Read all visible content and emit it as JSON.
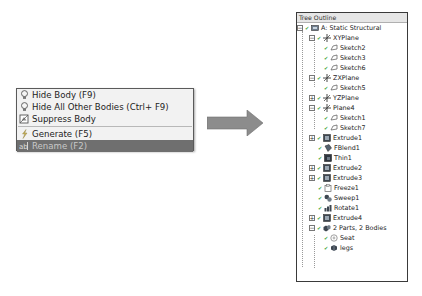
{
  "context_menu": {
    "items": [
      {
        "label": "Hide Body (F9)",
        "icon": "lightbulb-icon"
      },
      {
        "label": "Hide All Other Bodies (Ctrl+ F9)",
        "icon": "lightbulb-icon"
      },
      {
        "label": "Suppress Body",
        "icon": "suppress-body-icon"
      },
      {
        "label": "Generate (F5)",
        "icon": "lightning-icon"
      },
      {
        "label": "Rename (F2)",
        "icon": "rename-icon",
        "selected": true
      }
    ]
  },
  "tree_outline": {
    "title": "Tree Outline",
    "nodes": [
      {
        "label": "A: Static Structural",
        "level": 0,
        "expander": "−",
        "icon": "model-icon"
      },
      {
        "label": "XYPlane",
        "level": 1,
        "expander": "−",
        "icon": "plane-icon"
      },
      {
        "label": "Sketch2",
        "level": 2,
        "icon": "sketch-icon"
      },
      {
        "label": "Sketch3",
        "level": 2,
        "icon": "sketch-icon"
      },
      {
        "label": "Sketch6",
        "level": 2,
        "icon": "sketch-icon"
      },
      {
        "label": "ZXPlane",
        "level": 1,
        "expander": "−",
        "icon": "plane-icon"
      },
      {
        "label": "Sketch5",
        "level": 2,
        "icon": "sketch-icon"
      },
      {
        "label": "YZPlane",
        "level": 1,
        "expander": "+",
        "icon": "plane-icon"
      },
      {
        "label": "Plane4",
        "level": 1,
        "expander": "−",
        "icon": "plane-icon"
      },
      {
        "label": "Sketch1",
        "level": 2,
        "icon": "sketch-icon"
      },
      {
        "label": "Sketch7",
        "level": 2,
        "icon": "sketch-icon"
      },
      {
        "label": "Extrude1",
        "level": 1,
        "expander": "+",
        "icon": "extrude-icon"
      },
      {
        "label": "FBlend1",
        "level": 1,
        "icon": "blend-icon"
      },
      {
        "label": "Thin1",
        "level": 1,
        "icon": "thin-icon"
      },
      {
        "label": "Extrude2",
        "level": 1,
        "expander": "+",
        "icon": "extrude-icon"
      },
      {
        "label": "Extrude3",
        "level": 1,
        "expander": "+",
        "icon": "extrude-icon"
      },
      {
        "label": "Freeze1",
        "level": 1,
        "icon": "freeze-icon"
      },
      {
        "label": "Sweep1",
        "level": 1,
        "icon": "sweep-icon"
      },
      {
        "label": "Rotate1",
        "level": 1,
        "icon": "rotate-icon"
      },
      {
        "label": "Extrude4",
        "level": 1,
        "expander": "+",
        "icon": "extrude-icon"
      },
      {
        "label": "2 Parts, 2 Bodies",
        "level": 1,
        "expander": "−",
        "icon": "parts-icon"
      },
      {
        "label": "Seat",
        "level": 2,
        "icon": "body-icon"
      },
      {
        "label": "legs",
        "level": 2,
        "icon": "body-icon"
      }
    ]
  }
}
